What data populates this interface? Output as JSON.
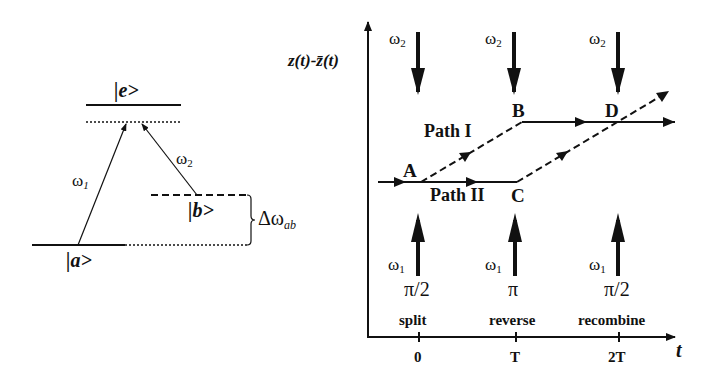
{
  "level_diagram": {
    "excited_state": "|e>",
    "ground_state_a": "|a>",
    "ground_state_b": "|b>",
    "beam1": {
      "symbol": "ω",
      "sub": "1"
    },
    "beam2": {
      "symbol": "ω",
      "sub": "2"
    },
    "splitting": {
      "symbol": "Δω",
      "sub": "ab"
    }
  },
  "interferometer": {
    "y_axis_label": "z(t)-z̄(t)",
    "x_axis_label": "t",
    "pulses": [
      {
        "top": {
          "symbol": "ω",
          "sub": "2"
        },
        "bottom": {
          "symbol": "ω",
          "sub": "1"
        },
        "phase": "π/2",
        "stage": "split",
        "tick": "0"
      },
      {
        "top": {
          "symbol": "ω",
          "sub": "2"
        },
        "bottom": {
          "symbol": "ω",
          "sub": "1"
        },
        "phase": "π",
        "stage": "reverse",
        "tick": "T"
      },
      {
        "top": {
          "symbol": "ω",
          "sub": "2"
        },
        "bottom": {
          "symbol": "ω",
          "sub": "1"
        },
        "phase": "π/2",
        "stage": "recombine",
        "tick": "2T"
      }
    ],
    "points": {
      "A": "A",
      "B": "B",
      "C": "C",
      "D": "D"
    },
    "paths": {
      "path1": "Path I",
      "path2": "Path II"
    }
  }
}
